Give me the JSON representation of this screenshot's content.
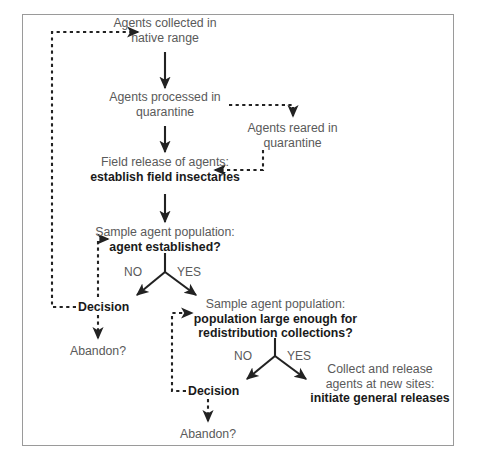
{
  "figure": {
    "type": "flowchart",
    "border_color": "#9a9a9a",
    "text_color": "#5a5a5a",
    "bold_text_color": "#1a1a1a",
    "arrow_color": "#222222"
  },
  "nodes": {
    "collected": {
      "line1": "Agents collected in",
      "line2": "native range"
    },
    "processed": {
      "line1": "Agents processed in",
      "line2": "quarantine"
    },
    "reared": {
      "line1": "Agents reared in",
      "line2": "quarantine"
    },
    "field_release": {
      "line1": "Field release of agents:",
      "line2": "establish field insectaries"
    },
    "sample1": {
      "line1": "Sample agent population:",
      "line2": "agent established?"
    },
    "decision1": {
      "label": "Decision"
    },
    "abandon1": {
      "label": "Abandon?"
    },
    "sample2": {
      "line1": "Sample agent population:",
      "line2": "population large enough for",
      "line3": "redistribution collections?"
    },
    "decision2": {
      "label": "Decision"
    },
    "abandon2": {
      "label": "Abandon?"
    },
    "collect_release": {
      "line1": "Collect and release",
      "line2": "agents at new sites:",
      "line3": "initiate general releases"
    }
  },
  "branch_labels": {
    "fork1_no": "NO",
    "fork1_yes": "YES",
    "fork2_no": "NO",
    "fork2_yes": "YES"
  }
}
